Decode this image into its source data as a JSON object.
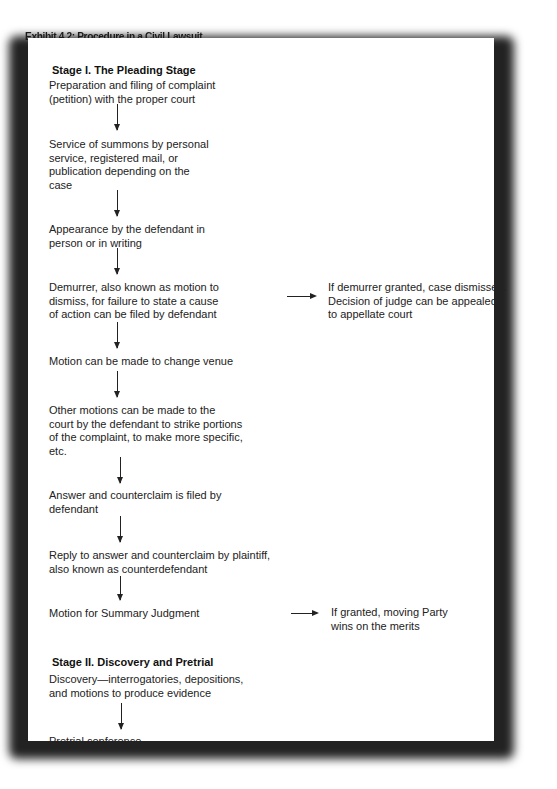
{
  "title": "Exhibit 4.2:  Procedure in a Civil Lawsuit",
  "stage1": {
    "heading": "Stage I. The Pleading Stage",
    "steps": [
      "Preparation and filing of complaint\n(petition) with the proper court",
      "Service of summons by personal\nservice, registered mail, or\npublication depending on the\ncase",
      "Appearance by the defendant in\nperson or in writing",
      "Demurrer, also known as motion to\ndismiss, for failure to state a cause\nof action can be filed by defendant",
      "Motion can be made to change venue",
      "Other motions can be made to the\ncourt by the defendant to strike portions\nof the complaint, to make more specific,\netc.",
      "Answer and counterclaim is filed by\ndefendant",
      "Reply to answer and counterclaim by plaintiff,\nalso known as counterdefendant",
      "Motion for Summary Judgment"
    ],
    "side_notes": [
      "If demurrer granted, case dismissed.\nDecision of judge can be appealed\nto appellate court",
      "If granted, moving Party\nwins on the merits"
    ]
  },
  "stage2": {
    "heading": "Stage II. Discovery and Pretrial",
    "steps": [
      "Discovery—interrogatories, depositions,\nand motions to produce evidence",
      "Pretrial conference"
    ]
  }
}
